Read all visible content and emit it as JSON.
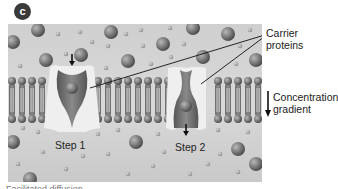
{
  "figure": {
    "badge": "c",
    "labels": {
      "carrier_proteins_line1": "Carrier",
      "carrier_proteins_line2": "proteins",
      "concentration_line1": "Concentration",
      "concentration_line2": "gradient",
      "step1": "Step 1",
      "step2": "Step 2"
    },
    "caption": "Facilitated diffusion",
    "colors": {
      "background_outer": "#d2d2d2",
      "background_inner": "#c6c6c6",
      "molecule": "#7a7a7a",
      "protein": "#efefef",
      "channel": "#6e6e6e",
      "phospholipid_head": "#737373",
      "text": "#222222"
    }
  }
}
